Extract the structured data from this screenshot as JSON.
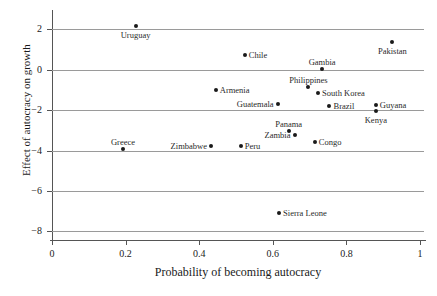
{
  "chart_data": {
    "type": "scatter",
    "title": "",
    "xlabel": "Probability of becoming autocracy",
    "ylabel": "Effect of autocracy on growth",
    "xlim": [
      0,
      1
    ],
    "ylim": [
      -8.6,
      2.6
    ],
    "xticks": [
      "0",
      "0.2",
      "0.4",
      "0.6",
      "0.8",
      "1"
    ],
    "xtick_values": [
      0,
      0.2,
      0.4,
      0.6,
      0.8,
      1
    ],
    "yticks": [
      "2",
      "0",
      "−2",
      "−4",
      "−6",
      "−8"
    ],
    "ytick_values": [
      2,
      0,
      -2,
      -4,
      -6,
      -8
    ],
    "grid": "horizontal",
    "legend": "none",
    "points": [
      {
        "label": "Uruguay",
        "x": 0.227,
        "y": 2.18,
        "pos": "below"
      },
      {
        "label": "Pakistan",
        "x": 0.925,
        "y": 1.38,
        "pos": "below"
      },
      {
        "label": "Chile",
        "x": 0.524,
        "y": 0.72,
        "pos": "right"
      },
      {
        "label": "Gambia",
        "x": 0.734,
        "y": 0.03,
        "pos": "above"
      },
      {
        "label": "Philippines",
        "x": 0.697,
        "y": -0.86,
        "pos": "above"
      },
      {
        "label": "Armenia",
        "x": 0.445,
        "y": -1.0,
        "pos": "right"
      },
      {
        "label": "South Korea",
        "x": 0.723,
        "y": -1.15,
        "pos": "right"
      },
      {
        "label": "Guatemala",
        "x": 0.613,
        "y": -1.7,
        "pos": "left"
      },
      {
        "label": "Brazil",
        "x": 0.754,
        "y": -1.78,
        "pos": "right"
      },
      {
        "label": "Guyana",
        "x": 0.88,
        "y": -1.77,
        "pos": "right"
      },
      {
        "label": "Kenya",
        "x": 0.88,
        "y": -2.05,
        "pos": "below"
      },
      {
        "label": "Panama",
        "x": 0.643,
        "y": -3.03,
        "pos": "above"
      },
      {
        "label": "Zambia",
        "x": 0.659,
        "y": -3.24,
        "pos": "left"
      },
      {
        "label": "Congo",
        "x": 0.714,
        "y": -3.56,
        "pos": "right"
      },
      {
        "label": "Peru",
        "x": 0.513,
        "y": -3.76,
        "pos": "right"
      },
      {
        "label": "Zimbabwe",
        "x": 0.432,
        "y": -3.79,
        "pos": "left"
      },
      {
        "label": "Greece",
        "x": 0.193,
        "y": -3.93,
        "pos": "above"
      },
      {
        "label": "Sierra Leone",
        "x": 0.617,
        "y": -7.08,
        "pos": "right"
      }
    ]
  }
}
